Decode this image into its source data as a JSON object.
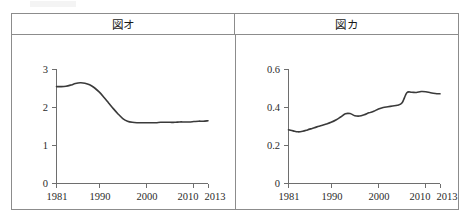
{
  "page": {
    "background_color": "#ffffff",
    "border_color": "#8c8c8c",
    "curve_color": "#3a3a3a",
    "axis_color": "#6e6e6e"
  },
  "panels": [
    {
      "id": "left",
      "title": "図オ"
    },
    {
      "id": "right",
      "title": "図カ"
    }
  ],
  "chart_data": [
    {
      "type": "line",
      "title": "図オ",
      "xlabel": "",
      "ylabel": "",
      "xlim": [
        1981,
        2013
      ],
      "ylim": [
        0,
        3
      ],
      "grid": false,
      "legend": null,
      "xticks": [
        1981,
        1990,
        2000,
        2010,
        2013
      ],
      "xtick_labels": [
        "1981",
        "1990",
        "2000",
        "2010",
        "2013"
      ],
      "yticks": [
        0,
        1,
        2,
        3
      ],
      "ytick_labels": [
        "0",
        "1",
        "2",
        "3"
      ],
      "series": [
        {
          "name": "図オ",
          "x": [
            1981,
            1982,
            1983,
            1984,
            1985,
            1986,
            1987,
            1988,
            1989,
            1990,
            1991,
            1992,
            1993,
            1994,
            1995,
            1996,
            1997,
            1998,
            1999,
            2000,
            2001,
            2002,
            2003,
            2004,
            2005,
            2006,
            2007,
            2008,
            2009,
            2010,
            2011,
            2012,
            2013
          ],
          "values": [
            2.55,
            2.55,
            2.56,
            2.59,
            2.63,
            2.65,
            2.64,
            2.6,
            2.52,
            2.41,
            2.27,
            2.12,
            1.97,
            1.83,
            1.71,
            1.64,
            1.61,
            1.6,
            1.6,
            1.6,
            1.6,
            1.6,
            1.61,
            1.61,
            1.61,
            1.61,
            1.62,
            1.62,
            1.62,
            1.63,
            1.64,
            1.64,
            1.65
          ]
        }
      ]
    },
    {
      "type": "line",
      "title": "図カ",
      "xlabel": "",
      "ylabel": "",
      "xlim": [
        1981,
        2013
      ],
      "ylim": [
        0,
        0.6
      ],
      "grid": false,
      "legend": null,
      "xticks": [
        1981,
        1990,
        2000,
        2010,
        2013
      ],
      "xtick_labels": [
        "1981",
        "1990",
        "2000",
        "2010",
        "2013"
      ],
      "yticks": [
        0,
        0.2,
        0.4,
        0.6
      ],
      "ytick_labels": [
        "0",
        "0.2",
        "0.4",
        "0.6"
      ],
      "series": [
        {
          "name": "図カ",
          "x": [
            1981,
            1982,
            1983,
            1984,
            1985,
            1986,
            1987,
            1988,
            1989,
            1990,
            1991,
            1992,
            1993,
            1994,
            1995,
            1996,
            1997,
            1998,
            1999,
            2000,
            2001,
            2002,
            2003,
            2004,
            2005,
            2006,
            2007,
            2008,
            2009,
            2010,
            2011,
            2012,
            2013
          ],
          "values": [
            0.283,
            0.277,
            0.272,
            0.275,
            0.282,
            0.29,
            0.298,
            0.305,
            0.313,
            0.322,
            0.334,
            0.35,
            0.367,
            0.368,
            0.357,
            0.355,
            0.362,
            0.372,
            0.38,
            0.392,
            0.4,
            0.404,
            0.408,
            0.412,
            0.425,
            0.478,
            0.48,
            0.479,
            0.484,
            0.483,
            0.478,
            0.474,
            0.472
          ]
        }
      ]
    }
  ]
}
